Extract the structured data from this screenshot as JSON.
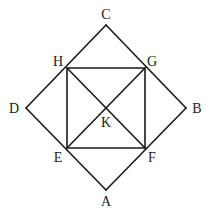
{
  "diagram": {
    "type": "geometry",
    "points": {
      "A": {
        "label": "A",
        "x": 106,
        "y": 190,
        "lx": 106,
        "ly": 206
      },
      "B": {
        "label": "B",
        "x": 186,
        "y": 108,
        "lx": 197,
        "ly": 113
      },
      "C": {
        "label": "C",
        "x": 106,
        "y": 25,
        "lx": 106,
        "ly": 19
      },
      "D": {
        "label": "D",
        "x": 26,
        "y": 108,
        "lx": 14,
        "ly": 113
      },
      "E": {
        "label": "E",
        "x": 67,
        "y": 148,
        "lx": 58,
        "ly": 162
      },
      "F": {
        "label": "F",
        "x": 145,
        "y": 148,
        "lx": 152,
        "ly": 162
      },
      "G": {
        "label": "G",
        "x": 145,
        "y": 68,
        "lx": 152,
        "ly": 66
      },
      "H": {
        "label": "H",
        "x": 67,
        "y": 68,
        "lx": 58,
        "ly": 66
      },
      "K": {
        "label": "K",
        "x": 106,
        "y": 108,
        "lx": 106,
        "ly": 127
      }
    },
    "segments": [
      [
        "A",
        "B"
      ],
      [
        "B",
        "C"
      ],
      [
        "C",
        "D"
      ],
      [
        "D",
        "A"
      ],
      [
        "E",
        "F"
      ],
      [
        "F",
        "G"
      ],
      [
        "G",
        "H"
      ],
      [
        "H",
        "E"
      ],
      [
        "E",
        "G"
      ],
      [
        "H",
        "F"
      ]
    ]
  }
}
